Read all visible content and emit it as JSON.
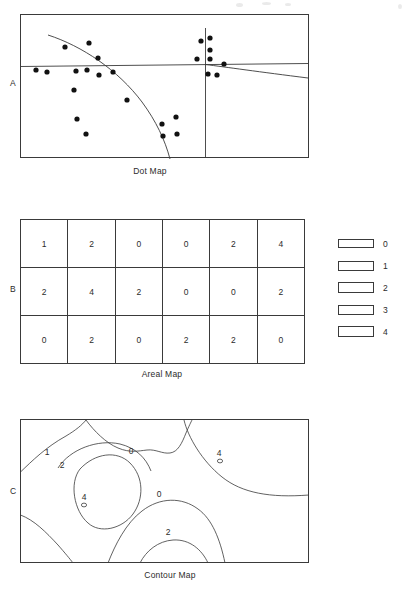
{
  "figure": {
    "panels": [
      {
        "key": "A",
        "label": "A",
        "caption": "Dot Map"
      },
      {
        "key": "B",
        "label": "B",
        "caption": "Areal Map"
      },
      {
        "key": "C",
        "label": "C",
        "caption": "Contour Map"
      }
    ]
  },
  "dot_map": {
    "label": "A",
    "caption": "Dot Map",
    "frame": {
      "x": 0,
      "y": 0,
      "width": 289,
      "height": 144
    },
    "dot_count": 25,
    "dot_radius": 2.6,
    "dots": [
      {
        "x": 16,
        "y": 56
      },
      {
        "x": 27,
        "y": 58
      },
      {
        "x": 45,
        "y": 33
      },
      {
        "x": 56,
        "y": 57
      },
      {
        "x": 54,
        "y": 76
      },
      {
        "x": 69,
        "y": 29
      },
      {
        "x": 67,
        "y": 56
      },
      {
        "x": 57,
        "y": 105
      },
      {
        "x": 66,
        "y": 120
      },
      {
        "x": 78,
        "y": 44
      },
      {
        "x": 79,
        "y": 61
      },
      {
        "x": 93,
        "y": 58
      },
      {
        "x": 107,
        "y": 86
      },
      {
        "x": 142,
        "y": 110
      },
      {
        "x": 143,
        "y": 122
      },
      {
        "x": 156,
        "y": 103
      },
      {
        "x": 157,
        "y": 120
      },
      {
        "x": 181,
        "y": 27
      },
      {
        "x": 177,
        "y": 45
      },
      {
        "x": 190,
        "y": 24
      },
      {
        "x": 190,
        "y": 36
      },
      {
        "x": 190,
        "y": 45
      },
      {
        "x": 188,
        "y": 60
      },
      {
        "x": 197,
        "y": 61
      },
      {
        "x": 204,
        "y": 50
      }
    ],
    "boundaries": {
      "horizontal_line": "a near-horizontal straight boundary crossing the full map width",
      "vertical_line": "a vertical boundary near the right side",
      "curve": "a concave curve descending from upper-left to lower-centre",
      "right_slope": "a shallow line sloping down to the right edge"
    }
  },
  "areal_map": {
    "label": "B",
    "caption": "Areal Map",
    "columns": 6,
    "rows": 3,
    "values": [
      [
        "1",
        "2",
        "0",
        "0",
        "2",
        "4"
      ],
      [
        "2",
        "4",
        "2",
        "0",
        "0",
        "2"
      ],
      [
        "0",
        "2",
        "0",
        "2",
        "2",
        "0"
      ]
    ]
  },
  "legend": {
    "title": "",
    "items": [
      {
        "label": "0",
        "class": "w0"
      },
      {
        "label": "1",
        "class": "w1"
      },
      {
        "label": "2",
        "class": "w2"
      },
      {
        "label": "3",
        "class": "w3"
      },
      {
        "label": "4",
        "class": "w4"
      }
    ]
  },
  "contour_map": {
    "label": "C",
    "caption": "Contour Map",
    "frame": {
      "x": 0,
      "y": 0,
      "width": 289,
      "height": 144
    },
    "contour_labels": [
      {
        "text": "1",
        "x": 27,
        "y": 33
      },
      {
        "text": "2",
        "x": 42,
        "y": 46
      },
      {
        "text": "0",
        "x": 111,
        "y": 32
      },
      {
        "text": "4",
        "x": 199,
        "y": 34
      },
      {
        "text": "4",
        "x": 64,
        "y": 78
      },
      {
        "text": "0",
        "x": 139,
        "y": 75
      },
      {
        "text": "2",
        "x": 148,
        "y": 113
      }
    ],
    "spot_heights": [
      {
        "x": 64,
        "y": 86,
        "rx": 2.6,
        "ry": 1.9
      },
      {
        "x": 200,
        "y": 42,
        "rx": 2.6,
        "ry": 1.9
      }
    ],
    "interval_note": "closed contours labelled 1, 2 and 4 around two highs; 0 contours separate the lows"
  },
  "colors": {
    "ink": "#3a3a3a",
    "text": "#2b2b2b",
    "dot": "#111111",
    "background": "#ffffff"
  }
}
